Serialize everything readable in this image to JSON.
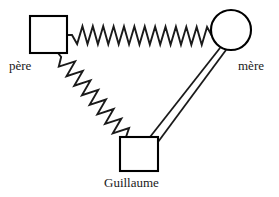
{
  "figure": {
    "background_color": "#ffffff",
    "stroke_color": "#1a1a1a",
    "fill_color": "#ffffff",
    "width": 279,
    "height": 197
  },
  "nodes": [
    {
      "id": "pere",
      "label": "père",
      "shape": "square",
      "x": 30,
      "y": 16,
      "width": 37,
      "height": 37,
      "label_x": 9,
      "label_y": 59
    },
    {
      "id": "mere",
      "label": "mère",
      "shape": "circle",
      "cx": 231,
      "cy": 30,
      "r": 20,
      "label_x": 238,
      "label_y": 59
    },
    {
      "id": "guillaume",
      "label": "Guillaume",
      "shape": "square",
      "x": 120,
      "y": 137,
      "width": 38,
      "height": 34,
      "label_x": 104,
      "label_y": 176
    }
  ],
  "connectors": [
    {
      "id": "spring-pere-mere",
      "type": "spring",
      "from": "pere",
      "to": "mere",
      "orientation": "horizontal",
      "coils": 13,
      "amplitude": 9,
      "x1": 67,
      "y1": 35,
      "x2": 212,
      "y2": 36
    },
    {
      "id": "spring-pere-guillaume",
      "type": "spring",
      "from": "pere",
      "to": "guillaume",
      "orientation": "diagonal",
      "coils": 8,
      "amplitude": 8,
      "x1": 58,
      "y1": 53,
      "x2": 126,
      "y2": 137
    },
    {
      "id": "rod-guillaume-mere",
      "type": "rigid-rod",
      "from": "guillaume",
      "to": "mere",
      "line_count": 2,
      "x1": 150,
      "y1": 137,
      "x2": 220,
      "y2": 48,
      "x3": 158,
      "y3": 142,
      "x4": 226,
      "y4": 50
    }
  ]
}
